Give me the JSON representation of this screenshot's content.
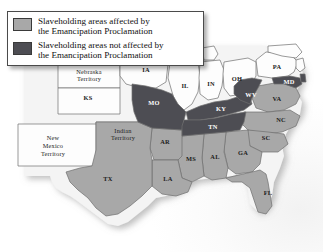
{
  "figure": {
    "name": "emancipation-proclamation-map",
    "type": "thematic-map",
    "region": "United States, 1863"
  },
  "legend": {
    "name": "map-legend",
    "items": [
      {
        "key": "affected",
        "swatch_color": "#a8a8a8",
        "line1": "Slaveholding areas affected by",
        "line2": "the Emancipation Proclamation"
      },
      {
        "key": "not_affected",
        "swatch_color": "#4d4d53",
        "line1": "Slaveholding areas not affected by",
        "line2": "the Emancipation Proclamation"
      }
    ]
  },
  "colors": {
    "affected": "#a8a8a8",
    "not_affected": "#4d4d53",
    "free_state": "#fdfdfd",
    "territory": "#fdfdfd",
    "border": "#6e6e6e",
    "ocean": "#f6f6f6",
    "label_dark": "#1c1c1c",
    "label_light": "#ffffff"
  },
  "map": {
    "labels": [
      {
        "id": "NE-TERR",
        "text": "Nebraska",
        "x": 89,
        "y": 73,
        "class": "territory",
        "style": "terr"
      },
      {
        "id": "NE-TERR2",
        "text": "Territory",
        "x": 89,
        "y": 80,
        "class": "territory",
        "style": "terr"
      },
      {
        "id": "IA",
        "text": "IA",
        "x": 146,
        "y": 71,
        "class": "free",
        "style": "state"
      },
      {
        "id": "IL",
        "text": "IL",
        "x": 185,
        "y": 87,
        "class": "free",
        "style": "state"
      },
      {
        "id": "IN",
        "text": "IN",
        "x": 211,
        "y": 85,
        "class": "free",
        "style": "state"
      },
      {
        "id": "OH",
        "text": "OH",
        "x": 237,
        "y": 80,
        "class": "free",
        "style": "state"
      },
      {
        "id": "PA",
        "text": "PA",
        "x": 277,
        "y": 68,
        "class": "free",
        "style": "state"
      },
      {
        "id": "MD",
        "text": "MD",
        "x": 289,
        "y": 83,
        "class": "not_affected",
        "style": "state-dark"
      },
      {
        "id": "KS",
        "text": "KS",
        "x": 88,
        "y": 99,
        "class": "free",
        "style": "state"
      },
      {
        "id": "MO",
        "text": "MO",
        "x": 154,
        "y": 104,
        "class": "not_affected",
        "style": "state-dark"
      },
      {
        "id": "KY",
        "text": "KY",
        "x": 221,
        "y": 110,
        "class": "not_affected",
        "style": "state-dark"
      },
      {
        "id": "WV",
        "text": "WV",
        "x": 251,
        "y": 96,
        "class": "not_affected",
        "style": "state-dark"
      },
      {
        "id": "VA",
        "text": "VA",
        "x": 277,
        "y": 100,
        "class": "affected",
        "style": "state"
      },
      {
        "id": "NC",
        "text": "NC",
        "x": 281,
        "y": 121,
        "class": "affected",
        "style": "state"
      },
      {
        "id": "TN",
        "text": "TN",
        "x": 213,
        "y": 128,
        "class": "not_affected",
        "style": "state-dark"
      },
      {
        "id": "SC",
        "text": "SC",
        "x": 266,
        "y": 139,
        "class": "affected",
        "style": "state"
      },
      {
        "id": "IND-TERR",
        "text": "Indian",
        "x": 123,
        "y": 132,
        "class": "territory",
        "style": "terr"
      },
      {
        "id": "IND-TERR2",
        "text": "Territory",
        "x": 123,
        "y": 139,
        "class": "territory",
        "style": "terr"
      },
      {
        "id": "AR",
        "text": "AR",
        "x": 165,
        "y": 143,
        "class": "affected",
        "style": "state"
      },
      {
        "id": "NM-TERR",
        "text": "New",
        "x": 53,
        "y": 139,
        "class": "territory",
        "style": "terr"
      },
      {
        "id": "NM-TERR2",
        "text": "Mexico",
        "x": 53,
        "y": 147,
        "class": "territory",
        "style": "terr"
      },
      {
        "id": "NM-TERR3",
        "text": "Territory",
        "x": 53,
        "y": 155,
        "class": "territory",
        "style": "terr"
      },
      {
        "id": "MS",
        "text": "MS",
        "x": 191,
        "y": 160,
        "class": "affected",
        "style": "state"
      },
      {
        "id": "AL",
        "text": "AL",
        "x": 215,
        "y": 158,
        "class": "affected",
        "style": "state"
      },
      {
        "id": "GA",
        "text": "GA",
        "x": 243,
        "y": 154,
        "class": "affected",
        "style": "state"
      },
      {
        "id": "LA",
        "text": "LA",
        "x": 168,
        "y": 180,
        "class": "affected",
        "style": "state"
      },
      {
        "id": "TX",
        "text": "TX",
        "x": 108,
        "y": 180,
        "class": "affected",
        "style": "state"
      },
      {
        "id": "FL",
        "text": "FL",
        "x": 268,
        "y": 194,
        "class": "affected",
        "style": "state"
      }
    ]
  }
}
